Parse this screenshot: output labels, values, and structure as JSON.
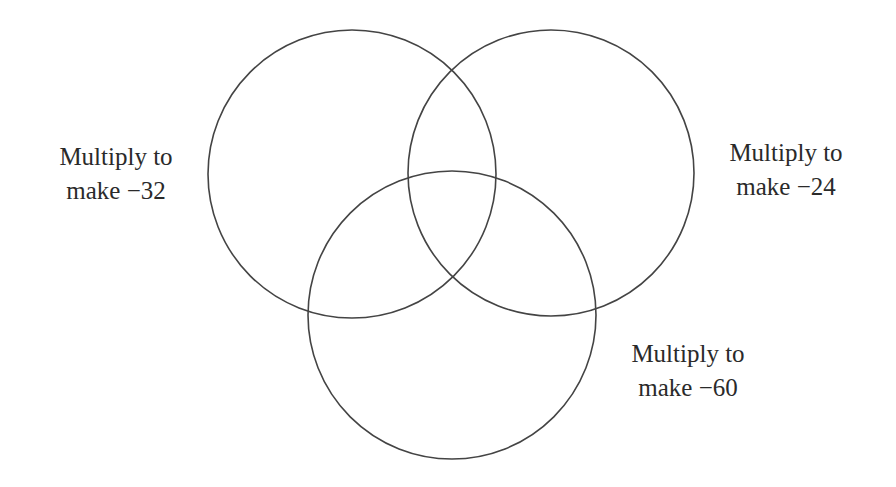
{
  "diagram": {
    "type": "venn-3",
    "stroke_color": "#444444",
    "circles": [
      {
        "id": "left",
        "cx": 352,
        "cy": 174,
        "r": 144
      },
      {
        "id": "right",
        "cx": 551,
        "cy": 173,
        "r": 143
      },
      {
        "id": "bottom",
        "cx": 452,
        "cy": 315,
        "r": 144
      }
    ],
    "labels": {
      "left": {
        "line1": "Multiply to",
        "line2": "make −32"
      },
      "right": {
        "line1": "Multiply to",
        "line2": "make −24"
      },
      "bottom": {
        "line1": "Multiply to",
        "line2": "make −60"
      }
    }
  }
}
